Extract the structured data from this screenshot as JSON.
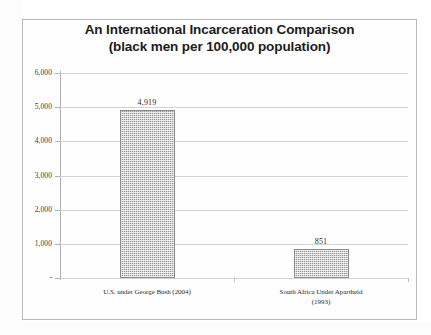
{
  "chart_data": {
    "type": "bar",
    "title": "An International Incarceration Comparison",
    "subtitle": "(black men per 100,000 population)",
    "categories": [
      "U.S. under George Bush (2004)",
      "South Africa Under Apartheid (1993)"
    ],
    "category_lines": [
      [
        "U.S. under George Bush (2004)"
      ],
      [
        "South Africa Under Apartheid",
        "(1993)"
      ]
    ],
    "values": [
      4919,
      851
    ],
    "value_labels": [
      "4,919",
      "851"
    ],
    "xlabel": "",
    "ylabel": "",
    "ylim": [
      0,
      6000
    ],
    "ytick_values": [
      6000,
      5000,
      4000,
      3000,
      2000,
      1000,
      0
    ],
    "ytick_labels": [
      "6,000",
      "5,000",
      "4,000",
      "3,000",
      "2,000",
      "1,000",
      "-"
    ],
    "grid": true,
    "legend": false,
    "bar_color": "#9b9b9b",
    "bar_pattern": "fine-checker",
    "grid_color": "#d4d4d4",
    "axis_color": "#9e9e9e",
    "title_color": "#1c1c1c",
    "frame_color": "#b9b9b9",
    "background_color": "#ffffff"
  }
}
